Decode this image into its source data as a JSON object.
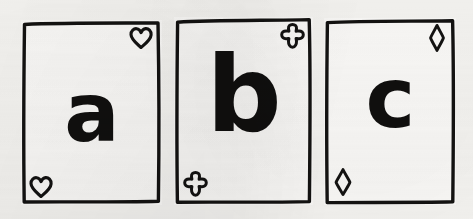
{
  "scene": {
    "title": "Three hand-drawn playing cards",
    "background_color": "#f6f5f2",
    "ink_color": "#100f0e",
    "card_face_color": "#fbfaf8",
    "style": "hand-drawn ink sketch on paper"
  },
  "cards": [
    {
      "id": "card-a",
      "letter": "a",
      "suit_name": "heart",
      "suit_glyph": "♡",
      "suit_style": "outline",
      "corner_positions": [
        "top-right",
        "bottom-left"
      ],
      "x": 21,
      "y": 20,
      "width": 141,
      "height": 185
    },
    {
      "id": "card-b",
      "letter": "b",
      "suit_name": "club",
      "suit_glyph": "♧",
      "suit_style": "outline",
      "corner_positions": [
        "top-right",
        "bottom-left"
      ],
      "x": 174,
      "y": 17,
      "width": 139,
      "height": 188
    },
    {
      "id": "card-c",
      "letter": "c",
      "suit_name": "diamond",
      "suit_glyph": "♢",
      "suit_style": "outline",
      "corner_positions": [
        "top-right",
        "bottom-left"
      ],
      "x": 324,
      "y": 18,
      "width": 132,
      "height": 187
    }
  ]
}
